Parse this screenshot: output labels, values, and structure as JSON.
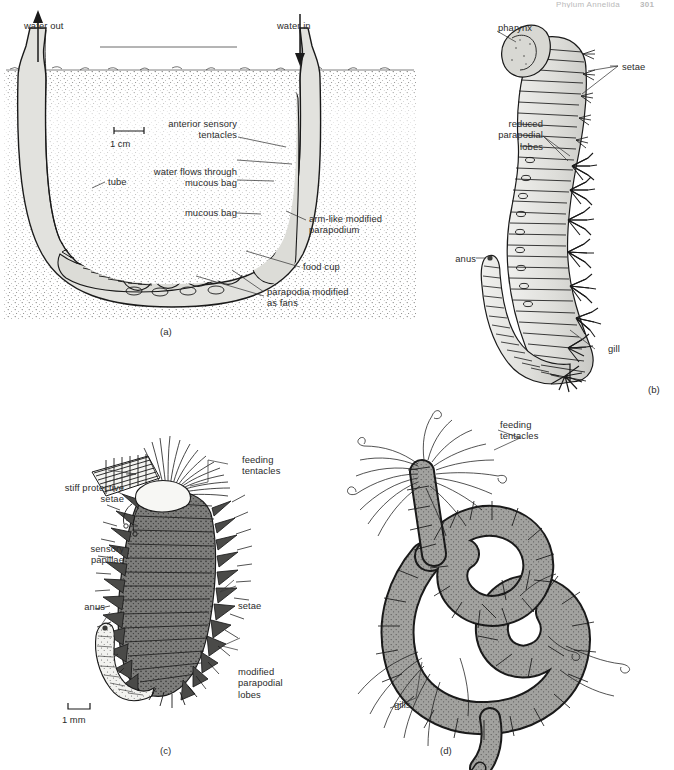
{
  "header": {
    "running_head": "Phylum Annelida",
    "page_number": "301"
  },
  "figure": {
    "panels": [
      {
        "id": "a",
        "caption_label": "(a)",
        "scale_bar": {
          "text": "1 cm",
          "style": "up-brackets"
        },
        "labels": [
          "water out",
          "water in",
          "anterior sensory\ntentacles",
          "water flows through\nmucous bag",
          "mucous bag",
          "tube",
          "arm-like modified\nparapodium",
          "food cup",
          "parapodia modified\nas fans"
        ]
      },
      {
        "id": "b",
        "caption_label": "(b)",
        "labels": [
          "pharynx",
          "setae",
          "reduced\nparapodial\nlobes",
          "anus",
          "gill"
        ]
      },
      {
        "id": "c",
        "caption_label": "(c)",
        "scale_bar": {
          "text": "1 mm",
          "style": "down-brackets"
        },
        "labels": [
          "feeding\ntentacles",
          "stiff protective\nsetae",
          "sensory\npapillae",
          "anus",
          "setae",
          "modified\nparapodial\nlobes"
        ]
      },
      {
        "id": "d",
        "caption_label": "(d)",
        "labels": [
          "feeding\ntentacles",
          "gills"
        ]
      }
    ]
  },
  "panel_a": {
    "water_out": "water out",
    "water_in": "water in",
    "anterior_sensory_tentacles": "anterior sensory\ntentacles",
    "water_flows_through_mucous_bag": "water flows through\nmucous bag",
    "mucous_bag": "mucous bag",
    "tube": "tube",
    "arm_like_modified_parapodium": "arm-like modified\nparapodium",
    "food_cup": "food cup",
    "parapodia_modified_as_fans": "parapodia modified\nas fans",
    "scale": "1 cm",
    "caption": "(a)"
  },
  "panel_b": {
    "pharynx": "pharynx",
    "setae": "setae",
    "reduced_parapodial_lobes": "reduced\nparapodial\nlobes",
    "anus": "anus",
    "gill": "gill",
    "caption": "(b)"
  },
  "panel_c": {
    "feeding_tentacles": "feeding\ntentacles",
    "stiff_protective_setae": "stiff protective\nsetae",
    "sensory_papillae": "sensory\npapillae",
    "anus": "anus",
    "setae": "setae",
    "modified_parapodial_lobes": "modified\nparapodial\nlobes",
    "scale": "1 mm",
    "caption": "(c)"
  },
  "panel_d": {
    "feeding_tentacles": "feeding\ntentacles",
    "gills": "gills",
    "caption": "(d)"
  },
  "colors": {
    "ink": "#1a1a1a",
    "label_text": "#2b2b2b",
    "tube_fill": "#e2e2de",
    "body_fill_light": "#dcdcd7",
    "body_fill_mid": "#9b9b99",
    "body_fill_dark": "#6f6f6d",
    "sediment": "#4a4a48",
    "page": "#ffffff"
  }
}
